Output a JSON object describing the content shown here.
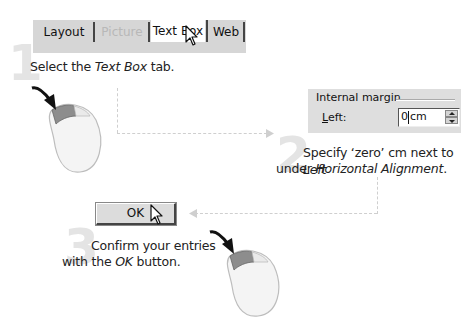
{
  "steps": [
    {
      "number": "1",
      "caption_pre": "Select the ",
      "caption_em": "Text Box",
      "caption_post": " tab."
    },
    {
      "number": "2",
      "line1_pre": "Specify ‘zero’ cm next to ",
      "line1_em": "Left",
      "line2_pre": "under ",
      "line2_em": "Horizontal Alignment",
      "line2_post": "."
    },
    {
      "number": "3",
      "line1": "Confirm your entries",
      "line2_pre": "with the ",
      "line2_em": "OK",
      "line2_post": " button."
    }
  ],
  "tabs": [
    {
      "label": "Layout",
      "state": "normal"
    },
    {
      "label": "Picture",
      "state": "disabled"
    },
    {
      "label": "Text Box",
      "state": "active"
    },
    {
      "label": "Web",
      "state": "normal"
    }
  ],
  "dialog": {
    "group_title": "Internal margin",
    "field_label_underlined": "L",
    "field_label_rest": "eft:",
    "field_value": "0",
    "field_unit": "cm"
  },
  "ok_button": {
    "label": "OK"
  },
  "icons": {
    "pointer": "arrow-cursor-icon",
    "mouse": "mouse-left-click-icon"
  },
  "colors": {
    "step_number": "#e4e4e4",
    "dialog_bg": "#dedede",
    "mouse_button": "#8a8a8a",
    "dashed_line": "#cfcfcf"
  }
}
